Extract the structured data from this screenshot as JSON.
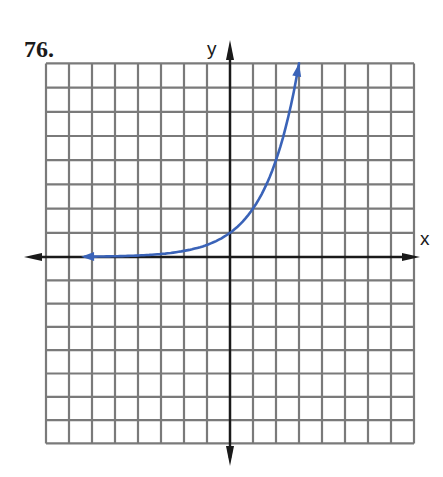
{
  "problem": {
    "number": "76."
  },
  "axes": {
    "x_label": "x",
    "y_label": "y"
  },
  "colors": {
    "grid": "#7a7a7a",
    "axis": "#1a1a1a",
    "curve": "#3a63b8"
  },
  "chart_data": {
    "type": "line",
    "title": "76.",
    "xlabel": "x",
    "ylabel": "y",
    "xlim": [
      -8,
      8
    ],
    "ylim": [
      -8,
      8
    ],
    "grid": true,
    "tick_labels": false,
    "legend": null,
    "series": [
      {
        "name": "y = 2^x",
        "x": [
          -6.3,
          -5,
          -4,
          -3,
          -2,
          -1,
          0,
          1,
          2,
          2.5,
          3
        ],
        "values": [
          0.013,
          0.031,
          0.063,
          0.125,
          0.25,
          0.5,
          1,
          2,
          4,
          5.66,
          8
        ],
        "arrows": "both ends"
      }
    ]
  }
}
